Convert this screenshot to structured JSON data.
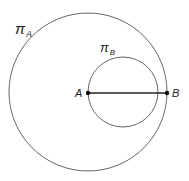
{
  "diagram": {
    "circles": [
      {
        "name": "πA",
        "cx": 88,
        "cy": 92,
        "r": 79,
        "label": "π",
        "subscript": "A"
      },
      {
        "name": "πB",
        "cx": 123,
        "cy": 92,
        "r": 35,
        "label": "π",
        "subscript": "B"
      }
    ],
    "points": [
      {
        "label": "A",
        "x": 88,
        "y": 93
      },
      {
        "label": "B",
        "x": 167,
        "y": 93
      }
    ],
    "segment": {
      "from": "A",
      "to": "B"
    },
    "colors": {
      "stroke": "#555555",
      "segment": "#222222",
      "point": "#111111"
    }
  }
}
